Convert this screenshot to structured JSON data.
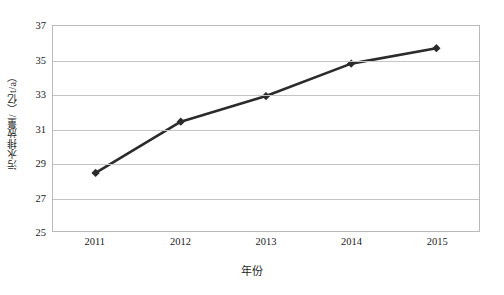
{
  "chart_data": {
    "type": "line",
    "title": "",
    "xlabel": "年份",
    "ylabel": "污水排放量/（亿t/a）",
    "categories": [
      "2011",
      "2012",
      "2013",
      "2014",
      "2015"
    ],
    "values": [
      28.4,
      31.4,
      32.9,
      34.8,
      35.7
    ],
    "series": [
      {
        "name": "污水排放量",
        "values": [
          28.4,
          31.4,
          32.9,
          34.8,
          35.7
        ]
      }
    ],
    "ylim": [
      25,
      37
    ],
    "yticks": [
      25,
      27,
      29,
      31,
      33,
      35,
      37
    ],
    "ytick_labels": [
      "25",
      "27",
      "29",
      "31",
      "33",
      "35",
      "37"
    ],
    "xtick_labels": [
      "2011",
      "2012",
      "2013",
      "2014",
      "2015"
    ],
    "grid": "horizontal",
    "legend": "none",
    "marker": "diamond",
    "line_color": "#2b2b2b",
    "marker_color": "#2b2b2b",
    "grid_color": "#c4c4c4",
    "plot_border_color": "#b9b9b9",
    "background_color": "#ffffff"
  }
}
